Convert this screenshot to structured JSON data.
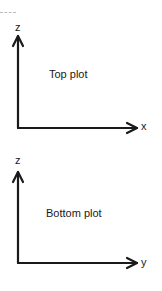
{
  "diagram": {
    "panels": [
      {
        "title": "Top plot",
        "vertical_axis_label": "z",
        "horizontal_axis_label": "x"
      },
      {
        "title": "Bottom plot",
        "vertical_axis_label": "z",
        "horizontal_axis_label": "y"
      }
    ],
    "colors": {
      "ink": "#1a1a1a",
      "background": "#ffffff"
    }
  }
}
